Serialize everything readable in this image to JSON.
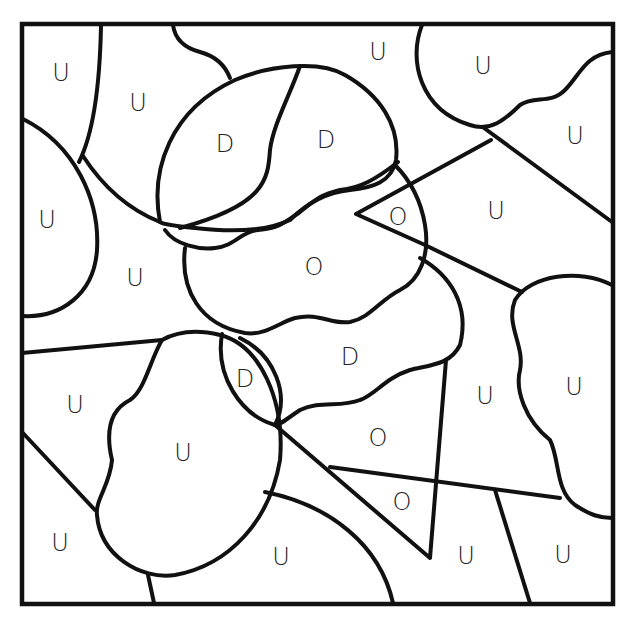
{
  "page": {
    "type": "color-by-letter coloring page",
    "background": "#ffffff",
    "line_color": "#111111"
  },
  "labels": [
    {
      "id": "r1",
      "letter": "U",
      "x": 61,
      "y": 73
    },
    {
      "id": "r2",
      "letter": "U",
      "x": 138,
      "y": 103
    },
    {
      "id": "r3",
      "letter": "U",
      "x": 378,
      "y": 52
    },
    {
      "id": "r4",
      "letter": "U",
      "x": 483,
      "y": 66
    },
    {
      "id": "r5",
      "letter": "U",
      "x": 575,
      "y": 136
    },
    {
      "id": "r6",
      "letter": "D",
      "x": 225,
      "y": 144
    },
    {
      "id": "r7",
      "letter": "D",
      "x": 326,
      "y": 140
    },
    {
      "id": "r8",
      "letter": "U",
      "x": 47,
      "y": 220
    },
    {
      "id": "r9",
      "letter": "O",
      "x": 398,
      "y": 217
    },
    {
      "id": "r10",
      "letter": "U",
      "x": 496,
      "y": 211
    },
    {
      "id": "r11",
      "letter": "U",
      "x": 135,
      "y": 278
    },
    {
      "id": "r12",
      "letter": "O",
      "x": 314,
      "y": 267
    },
    {
      "id": "r13",
      "letter": "D",
      "x": 350,
      "y": 357
    },
    {
      "id": "r14",
      "letter": "D",
      "x": 245,
      "y": 379
    },
    {
      "id": "r15",
      "letter": "U",
      "x": 75,
      "y": 405
    },
    {
      "id": "r16",
      "letter": "U",
      "x": 485,
      "y": 396
    },
    {
      "id": "r17",
      "letter": "U",
      "x": 574,
      "y": 387
    },
    {
      "id": "r18",
      "letter": "U",
      "x": 183,
      "y": 453
    },
    {
      "id": "r19",
      "letter": "O",
      "x": 378,
      "y": 438
    },
    {
      "id": "r20",
      "letter": "O",
      "x": 402,
      "y": 502
    },
    {
      "id": "r21",
      "letter": "U",
      "x": 60,
      "y": 543
    },
    {
      "id": "r22",
      "letter": "U",
      "x": 281,
      "y": 557
    },
    {
      "id": "r23",
      "letter": "U",
      "x": 466,
      "y": 556
    },
    {
      "id": "r24",
      "letter": "U",
      "x": 563,
      "y": 555
    }
  ]
}
